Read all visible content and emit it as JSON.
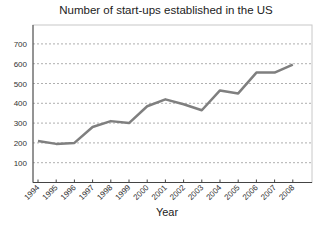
{
  "chart_data": {
    "type": "line",
    "title": "Number of start-ups established in the US",
    "xlabel": "Year",
    "ylabel": "",
    "categories": [
      "1994",
      "1995",
      "1996",
      "1997",
      "1998",
      "1999",
      "2000",
      "2001",
      "2002",
      "2003",
      "2004",
      "2005",
      "2006",
      "2007",
      "2008"
    ],
    "series": [
      {
        "name": "Start-ups",
        "values": [
          210,
          195,
          200,
          280,
          310,
          300,
          385,
          420,
          395,
          365,
          465,
          450,
          555,
          555,
          595
        ],
        "color": "#7f7f7f"
      }
    ],
    "yticks": [
      100,
      200,
      300,
      400,
      500,
      600,
      700
    ],
    "ylim": [
      0,
      790
    ],
    "grid": "horizontal dashed",
    "legend": "none"
  }
}
